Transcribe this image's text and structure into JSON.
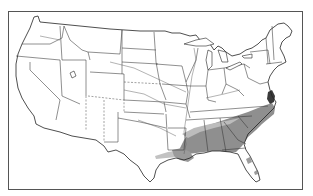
{
  "map": {
    "type": "range_map",
    "region": "Continental United States",
    "style": "black-and-white outline map",
    "features": {
      "state_borders": true,
      "major_rivers": true,
      "great_lakes": true
    },
    "shaded_range": {
      "description": "Gray-shaded distribution area across the southeastern United States",
      "states_covered": [
        "East Texas",
        "Louisiana",
        "Arkansas (south)",
        "Mississippi",
        "Alabama",
        "Georgia",
        "Tennessee (south)",
        "South Carolina",
        "North Carolina",
        "Virginia (coastal)",
        "Florida (north, scattered)"
      ],
      "colors": {
        "dense": "#8a8a8a",
        "light": "#bdbdbd",
        "dark_spots": "#333333"
      }
    },
    "frame_color": "#555555",
    "background": "#ffffff"
  }
}
